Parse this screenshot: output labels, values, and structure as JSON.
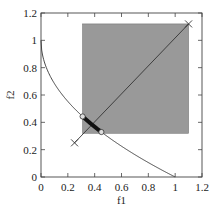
{
  "chart_data": {
    "type": "scatter",
    "title": "",
    "xlabel": "f1",
    "ylabel": "f2",
    "xlim": [
      0,
      1.2
    ],
    "ylim": [
      0,
      1.2
    ],
    "xticks": [
      "0",
      "0.2",
      "0.4",
      "0.6",
      "0.8",
      "1",
      "1.2"
    ],
    "yticks": [
      "0",
      "0.2",
      "0.4",
      "0.6",
      "0.8",
      "1",
      "1.2"
    ],
    "grid": false,
    "legend": null,
    "series": [
      {
        "name": "pareto-front",
        "kind": "line",
        "equation": "f2 = 1 - sqrt(f1)",
        "x_range": [
          0,
          1
        ],
        "color": "#333333"
      },
      {
        "name": "dominated-region",
        "kind": "rectangle",
        "x": [
          0.31,
          1.1
        ],
        "y": [
          0.32,
          1.12
        ],
        "color": "#999999"
      },
      {
        "name": "reference-line",
        "kind": "line",
        "points": [
          [
            0.25,
            0.25
          ],
          [
            1.1,
            1.12
          ]
        ],
        "color": "#333333"
      },
      {
        "name": "reference-points",
        "kind": "marker-x",
        "points": [
          [
            0.25,
            0.25
          ],
          [
            1.1,
            1.12
          ]
        ],
        "color": "#333333"
      },
      {
        "name": "highlighted-front-segment",
        "kind": "thick-line",
        "x_range": [
          0.31,
          0.45
        ],
        "color": "#111111"
      },
      {
        "name": "segment-endpoints",
        "kind": "marker-circle",
        "points": [
          [
            0.31,
            0.443
          ],
          [
            0.45,
            0.329
          ]
        ],
        "color": "#cccccc"
      }
    ]
  }
}
